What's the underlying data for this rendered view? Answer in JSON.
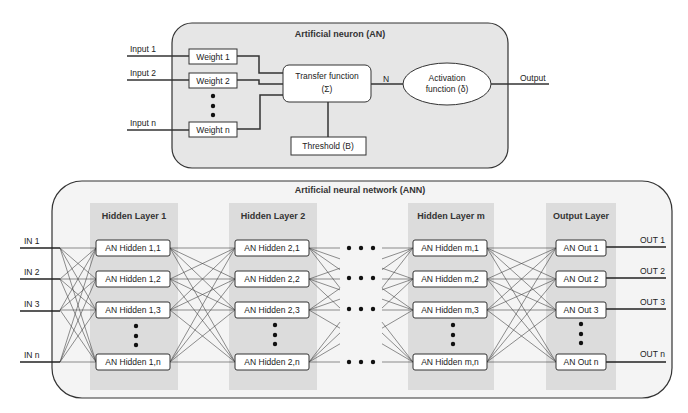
{
  "neuron": {
    "title": "Artificial neuron (AN)",
    "inputs": [
      "Input 1",
      "Input 2",
      "Input n"
    ],
    "weights": [
      "Weight 1",
      "Weight 2",
      "Weight n"
    ],
    "transfer_line1": "Transfer function",
    "transfer_line2": "(Σ)",
    "n_label": "N",
    "activation_line1": "Activation",
    "activation_line2": "function (δ)",
    "output_label": "Output",
    "threshold": "Threshold (B)"
  },
  "network": {
    "title": "Artificial neural network (ANN)",
    "inputs": [
      "IN 1",
      "IN 2",
      "IN 3",
      "IN n"
    ],
    "outputs": [
      "OUT 1",
      "OUT 2",
      "OUT 3",
      "OUT n"
    ],
    "layers": [
      {
        "title": "Hidden Layer 1",
        "nodes": [
          "AN Hidden 1,1",
          "AN Hidden 1,2",
          "AN Hidden 1,3",
          "AN Hidden 1,n"
        ]
      },
      {
        "title": "Hidden Layer 2",
        "nodes": [
          "AN Hidden 2,1",
          "AN Hidden 2,2",
          "AN Hidden 2,3",
          "AN Hidden 2,n"
        ]
      },
      {
        "title": "Hidden Layer m",
        "nodes": [
          "AN Hidden m,1",
          "AN Hidden m,2",
          "AN Hidden m,3",
          "AN Hidden m,n"
        ]
      },
      {
        "title": "Output Layer",
        "nodes": [
          "AN Out 1",
          "AN Out 2",
          "AN Out 3",
          "AN Out n"
        ]
      }
    ]
  },
  "colors": {
    "panel_fill": "#e6e6e6",
    "layer_shade": "#dcdcdc",
    "ann_fill": "#f4f4f4",
    "stroke": "#333333"
  }
}
